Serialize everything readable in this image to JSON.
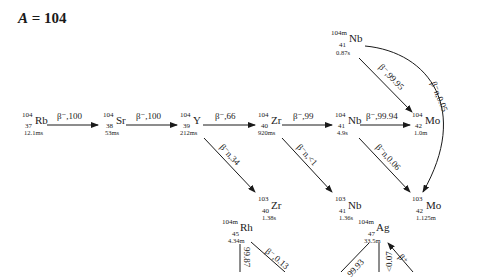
{
  "title": {
    "var": "A",
    "eq": " = ",
    "value": "104"
  },
  "nuclides": [
    {
      "id": "rb104",
      "A": "104",
      "Z": "37",
      "sym": "Rb",
      "hl": "12.1ms",
      "x": 22,
      "y": 112
    },
    {
      "id": "sr104",
      "A": "104",
      "Z": "38",
      "sym": "Sr",
      "hl": "53ms",
      "x": 103,
      "y": 112
    },
    {
      "id": "y104",
      "A": "104",
      "Z": "39",
      "sym": "Y",
      "hl": "212ms",
      "x": 180,
      "y": 112
    },
    {
      "id": "zr104",
      "A": "104",
      "Z": "40",
      "sym": "Zr",
      "hl": "920ms",
      "x": 258,
      "y": 112
    },
    {
      "id": "nb104",
      "A": "104",
      "Z": "41",
      "sym": "Nb",
      "hl": "4.9s",
      "x": 335,
      "y": 112
    },
    {
      "id": "mo104",
      "A": "104",
      "Z": "42",
      "sym": "Mo",
      "hl": "1.0m",
      "x": 412,
      "y": 112
    },
    {
      "id": "nb104m",
      "A": "104m",
      "Z": "41",
      "sym": "Nb",
      "hl": "0.87s",
      "x": 335,
      "y": 30
    },
    {
      "id": "zr103",
      "A": "103",
      "Z": "40",
      "sym": "Zr",
      "hl": "1.38s",
      "x": 258,
      "y": 196
    },
    {
      "id": "nb103",
      "A": "103",
      "Z": "41",
      "sym": "Nb",
      "hl": "1.36s",
      "x": 335,
      "y": 196
    },
    {
      "id": "mo103",
      "A": "103",
      "Z": "42",
      "sym": "Mo",
      "hl": "1.125m",
      "x": 412,
      "y": 196
    },
    {
      "id": "rh104m",
      "A": "104m",
      "Z": "45",
      "sym": "Rh",
      "hl": "4.34m",
      "x": 222,
      "y": 219
    },
    {
      "id": "ag104m",
      "A": "104m",
      "Z": "47",
      "sym": "Ag",
      "hl": "33.5m",
      "x": 356,
      "y": 219
    }
  ],
  "transitions": [
    {
      "from": "rb104",
      "to": "sr104",
      "label": "β⁻,100"
    },
    {
      "from": "sr104",
      "to": "y104",
      "label": "β⁻,100"
    },
    {
      "from": "y104",
      "to": "zr104",
      "label": "β⁻,66"
    },
    {
      "from": "zr104",
      "to": "nb104",
      "label": "β⁻,99"
    },
    {
      "from": "nb104",
      "to": "mo104",
      "label": "β⁻,99.94"
    },
    {
      "from": "y104",
      "to": "zr103",
      "label": "β⁻n,34"
    },
    {
      "from": "zr104",
      "to": "nb103",
      "label": "β⁻n,<1"
    },
    {
      "from": "nb104",
      "to": "mo103",
      "label": "β⁻n,0.06"
    },
    {
      "from": "nb104m",
      "to": "mo104",
      "label": "β⁻,99.95"
    },
    {
      "from": "nb104m",
      "to": "mo103",
      "label": "β⁻n,0.05"
    },
    {
      "from": "rh104m",
      "to": "",
      "label": "99.87"
    },
    {
      "from": "rh104m",
      "to": "",
      "label": "β⁻,0.13"
    },
    {
      "from": "ag104m",
      "to": "",
      "label": "99.93"
    },
    {
      "from": "ag104m",
      "to": "",
      "label": "<0.07"
    },
    {
      "from": "",
      "to": "ag104m",
      "label": "β⁺"
    }
  ]
}
